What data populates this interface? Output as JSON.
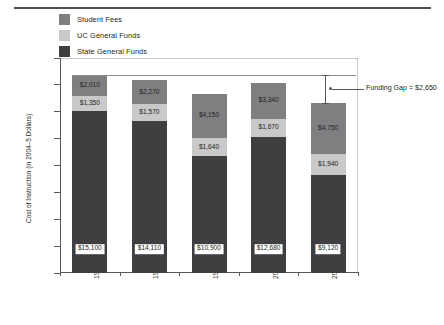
{
  "chart_data": {
    "type": "bar",
    "stacked": true,
    "title": "",
    "xlabel": "",
    "ylabel": "Cost of Instruction (in 2004–5 Dollars)",
    "ylim": [
      0,
      20000
    ],
    "ytick_step": 2500,
    "ytick_labels": [
      "$0",
      "$2,500",
      "$5,000",
      "$7,500",
      "$10,000",
      "$12,500",
      "$15,000",
      "$17,500",
      "$20,000"
    ],
    "ytick_values": [
      0,
      2500,
      5000,
      7500,
      10000,
      12500,
      15000,
      17500,
      20000
    ],
    "grid": false,
    "legend_position": "top-left",
    "categories": [
      "1985–86",
      "1990–91",
      "1995–96",
      "2000–1",
      "2004–5"
    ],
    "series": [
      {
        "name": "State General Funds",
        "color": "#3f3f42",
        "values": [
          15100,
          14110,
          10900,
          12680,
          9120
        ],
        "labels": [
          "$15,100",
          "$14,110",
          "$10,900",
          "$12,680",
          "$9,120"
        ]
      },
      {
        "name": "UC General Funds",
        "color": "#c9c9c9",
        "values": [
          1350,
          1570,
          1640,
          1670,
          1940
        ],
        "labels": [
          "$1,350",
          "$1,570",
          "$1,640",
          "$1,670",
          "$1,940"
        ]
      },
      {
        "name": "Student Fees",
        "color": "#7f7f82",
        "values": [
          2010,
          2270,
          4150,
          3340,
          4750
        ],
        "labels": [
          "$2,010",
          "$2,270",
          "$4,150",
          "$3,340",
          "$4,750"
        ]
      }
    ],
    "totals": [
      18460,
      17950,
      16690,
      17690,
      15810
    ],
    "reference_line_value": 18460,
    "annotation": {
      "text": "Funding Gap = $2,650",
      "value": 2650,
      "from": 15810,
      "to": 18460
    }
  },
  "legend": {
    "items": [
      {
        "label": "Student Fees",
        "color": "#7f7f82"
      },
      {
        "label": "UC General Funds",
        "color": "#c9c9c9"
      },
      {
        "label": "State General Funds",
        "color": "#3f3f42"
      }
    ]
  }
}
